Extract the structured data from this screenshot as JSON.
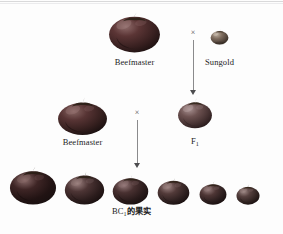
{
  "figure": {
    "background_color": "#fdfdfd",
    "width": 283,
    "height": 234,
    "scan_artifact_color": "#d2d2d4"
  },
  "generations": {
    "parental": {
      "cross_symbol": "×",
      "parent_left": {
        "label": "Beefmaster",
        "fruit": {
          "name": "beefmaster-fruit-large",
          "x": 108,
          "y": 11,
          "w": 53,
          "h": 42,
          "body_color": "#4a2a2a",
          "shade_color": "#2a1616",
          "highlight_color": "#9a7676",
          "calyx_color": "#2b1f16"
        }
      },
      "parent_right": {
        "label": "Sungold",
        "fruit": {
          "name": "sungold-fruit-small",
          "x": 210,
          "y": 29,
          "w": 19,
          "h": 16,
          "body_color": "#6b5a4e",
          "shade_color": "#3e342c",
          "highlight_color": "#b5a79a",
          "calyx_color": "#3a2e22"
        }
      },
      "arrow": {
        "x": 193,
        "y_top": 40,
        "y_bottom": 95
      }
    },
    "backcross": {
      "cross_symbol": "×",
      "parent_left": {
        "label": "Beefmaster",
        "fruit": {
          "name": "beefmaster-fruit-medium",
          "x": 57,
          "y": 97,
          "w": 51,
          "h": 38,
          "body_color": "#44292a",
          "shade_color": "#271617",
          "highlight_color": "#90706f",
          "calyx_color": "#2b1f16"
        }
      },
      "parent_right": {
        "label": "F",
        "label_subscript": "1",
        "fruit": {
          "name": "f1-fruit",
          "x": 177,
          "y": 98,
          "w": 36,
          "h": 31,
          "body_color": "#5d4545",
          "shade_color": "#372727",
          "highlight_color": "#a08b8a",
          "calyx_color": "#33281c"
        }
      },
      "arrow": {
        "x": 137,
        "y_top": 120,
        "y_bottom": 168
      }
    },
    "offspring": {
      "label": "BC",
      "label_subscript": "1",
      "label_cjk": "的果实",
      "fruits": [
        {
          "name": "bc1-fruit-1",
          "x": 9,
          "y": 166,
          "w": 48,
          "h": 39,
          "body_color": "#3e2525",
          "shade_color": "#211313",
          "highlight_color": "#8a6b6a",
          "calyx_color": "#2b1f16"
        },
        {
          "name": "bc1-fruit-2",
          "x": 64,
          "y": 171,
          "w": 41,
          "h": 34,
          "body_color": "#4d3535",
          "shade_color": "#2b1c1c",
          "highlight_color": "#9c8180",
          "calyx_color": "#2e2218"
        },
        {
          "name": "bc1-fruit-3",
          "x": 112,
          "y": 174,
          "w": 37,
          "h": 31,
          "body_color": "#493131",
          "shade_color": "#281a1a",
          "highlight_color": "#95797a",
          "calyx_color": "#2e2218"
        },
        {
          "name": "bc1-fruit-4",
          "x": 157,
          "y": 177,
          "w": 33,
          "h": 28,
          "body_color": "#523a39",
          "shade_color": "#2d1f1f",
          "highlight_color": "#9d8483",
          "calyx_color": "#31241a"
        },
        {
          "name": "bc1-fruit-5",
          "x": 199,
          "y": 181,
          "w": 28,
          "h": 24,
          "body_color": "#4e3635",
          "shade_color": "#2a1d1d",
          "highlight_color": "#967d7c",
          "calyx_color": "#31241a"
        },
        {
          "name": "bc1-fruit-6",
          "x": 236,
          "y": 184,
          "w": 24,
          "h": 21,
          "body_color": "#55403e",
          "shade_color": "#2f2220",
          "highlight_color": "#9e8885",
          "calyx_color": "#342719"
        }
      ]
    }
  }
}
